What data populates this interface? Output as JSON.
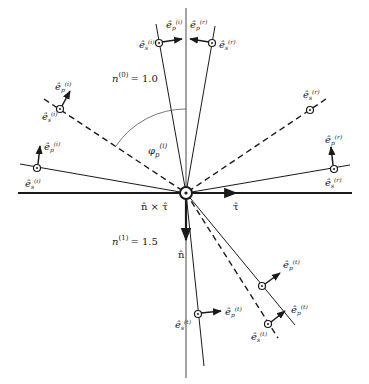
{
  "diagram": {
    "media": {
      "upper": {
        "label": "n",
        "superscript": "(0)",
        "value": "= 1.0"
      },
      "lower": {
        "label": "n",
        "superscript": "(1)",
        "value": "= 1.5"
      }
    },
    "axes": {
      "tangent": "τ̂",
      "normal": "n̂",
      "cross": "n̂ × τ̂"
    },
    "angle": {
      "label": "φ",
      "sub": "p",
      "sup": "(i)"
    },
    "vectors": {
      "incident_s": "ê",
      "incident_sup": "(i)",
      "s_sub": "s",
      "p_sub": "p",
      "reflected_sup": "(r)",
      "transmitted_sup": "(t)"
    },
    "colors": {
      "line": "#1a1a1a",
      "arc": "#555555"
    }
  }
}
